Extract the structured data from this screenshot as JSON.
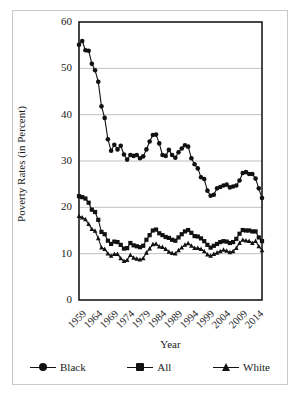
{
  "chart_data": {
    "type": "line",
    "title": "",
    "xlabel": "Year",
    "ylabel": "Poverty Rates (in Percent)",
    "xlim": [
      1959,
      2016
    ],
    "ylim": [
      0,
      60
    ],
    "ytick_values": [
      0,
      10,
      20,
      30,
      40,
      50,
      60
    ],
    "ytick_labels": [
      "0",
      "10",
      "20",
      "30",
      "40",
      "50",
      "60"
    ],
    "xtick_values": [
      1959,
      1964,
      1969,
      1974,
      1979,
      1984,
      1989,
      1994,
      1999,
      2004,
      2009,
      2014
    ],
    "xtick_labels": [
      "1959",
      "1964",
      "1969",
      "1974",
      "1979",
      "1984",
      "1989",
      "1994",
      "1999",
      "2004",
      "2009",
      "2014"
    ],
    "grid": "horizontal",
    "legend_position": "bottom",
    "marker_color": "#111111",
    "line_color": "#111111",
    "gridline_color": "#b0b0b0",
    "x": [
      1959,
      1960,
      1961,
      1962,
      1963,
      1964,
      1965,
      1966,
      1967,
      1968,
      1969,
      1970,
      1971,
      1972,
      1973,
      1974,
      1975,
      1976,
      1977,
      1978,
      1979,
      1980,
      1981,
      1982,
      1983,
      1984,
      1985,
      1986,
      1987,
      1988,
      1989,
      1990,
      1991,
      1992,
      1993,
      1994,
      1995,
      1996,
      1997,
      1998,
      1999,
      2000,
      2001,
      2002,
      2003,
      2004,
      2005,
      2006,
      2007,
      2008,
      2009,
      2010,
      2011,
      2012,
      2013,
      2014,
      2015,
      2016
    ],
    "series": [
      {
        "name": "Black",
        "marker": "circle",
        "values": [
          55.1,
          55.9,
          53.9,
          53.8,
          51.0,
          49.6,
          47.1,
          41.8,
          39.3,
          34.7,
          32.2,
          33.5,
          32.5,
          33.3,
          31.4,
          30.3,
          31.3,
          31.1,
          31.3,
          30.6,
          31.0,
          32.5,
          34.2,
          35.6,
          35.7,
          33.8,
          31.3,
          31.1,
          32.4,
          31.3,
          30.7,
          31.9,
          32.7,
          33.4,
          33.1,
          30.6,
          29.3,
          28.4,
          26.5,
          26.1,
          23.6,
          22.5,
          22.7,
          24.1,
          24.4,
          24.7,
          24.9,
          24.3,
          24.5,
          24.7,
          25.8,
          27.4,
          27.6,
          27.2,
          27.2,
          26.2,
          24.1,
          22.0
        ]
      },
      {
        "name": "All",
        "marker": "square",
        "values": [
          22.4,
          22.2,
          21.9,
          21.0,
          19.5,
          19.0,
          17.3,
          14.7,
          14.2,
          12.8,
          12.1,
          12.6,
          12.5,
          11.9,
          11.1,
          11.2,
          12.3,
          11.8,
          11.6,
          11.4,
          11.7,
          13.0,
          14.0,
          15.0,
          15.2,
          14.4,
          14.0,
          13.6,
          13.4,
          13.0,
          12.8,
          13.5,
          14.2,
          14.8,
          15.1,
          14.5,
          13.8,
          13.7,
          13.3,
          12.7,
          11.9,
          11.3,
          11.7,
          12.1,
          12.5,
          12.7,
          12.6,
          12.3,
          12.5,
          13.2,
          14.3,
          15.1,
          15.0,
          15.0,
          14.8,
          14.8,
          13.5,
          12.7
        ]
      },
      {
        "name": "White",
        "marker": "triangle",
        "values": [
          18.1,
          17.8,
          17.4,
          16.4,
          15.3,
          14.9,
          13.3,
          11.3,
          11.0,
          10.0,
          9.5,
          9.9,
          9.9,
          9.0,
          8.4,
          8.6,
          9.7,
          9.1,
          8.9,
          8.7,
          9.0,
          10.2,
          11.1,
          12.0,
          12.1,
          11.5,
          11.4,
          11.0,
          10.4,
          10.1,
          10.0,
          10.7,
          11.3,
          11.9,
          12.2,
          11.7,
          11.2,
          11.2,
          11.0,
          10.5,
          9.8,
          9.5,
          9.9,
          10.2,
          10.5,
          10.8,
          10.6,
          10.3,
          10.5,
          11.2,
          12.3,
          13.0,
          12.8,
          12.7,
          12.3,
          12.7,
          11.6,
          10.7
        ]
      }
    ]
  },
  "legend": {
    "entries": [
      {
        "label": "Black",
        "marker": "circle"
      },
      {
        "label": "All",
        "marker": "square"
      },
      {
        "label": "White",
        "marker": "triangle"
      }
    ]
  }
}
